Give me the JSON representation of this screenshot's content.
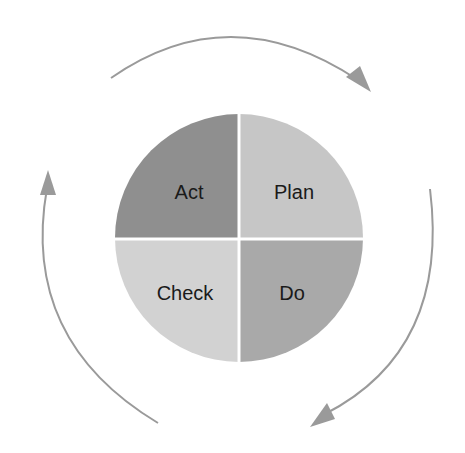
{
  "diagram": {
    "quadrants": [
      {
        "id": "act",
        "label": "Act",
        "position": "top-left",
        "color": "#8f8f8f"
      },
      {
        "id": "plan",
        "label": "Plan",
        "position": "top-right",
        "color": "#c6c6c6"
      },
      {
        "id": "check",
        "label": "Check",
        "position": "bottom-left",
        "color": "#d2d2d2"
      },
      {
        "id": "do",
        "label": "Do",
        "position": "bottom-right",
        "color": "#a9a9a9"
      }
    ],
    "arrows": [
      {
        "id": "top-arrow",
        "direction": "clockwise",
        "from": "top-left",
        "to": "top-right"
      },
      {
        "id": "right-arrow",
        "direction": "clockwise",
        "from": "right",
        "to": "bottom"
      },
      {
        "id": "left-arrow",
        "direction": "clockwise",
        "from": "bottom-left",
        "to": "left-top"
      }
    ],
    "arrow_color": "#9a9a9a",
    "divider_color": "#ffffff",
    "cycle_order": [
      "Plan",
      "Do",
      "Check",
      "Act"
    ]
  }
}
